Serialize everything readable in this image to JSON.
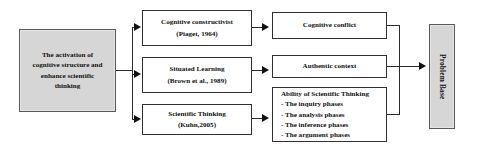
{
  "diagram": {
    "source": {
      "lines": [
        "The activation of",
        "cognitive structure and",
        "enhance scientific",
        "thinking"
      ]
    },
    "theories": [
      {
        "title": "Cognitive constructivist",
        "citation": "(Piaget, 1964)"
      },
      {
        "title": "Situated Learning",
        "citation": "(Brown et al., 1989)"
      },
      {
        "title": "Scientific Thinking",
        "citation": "(Kuhn,2005)"
      }
    ],
    "outcomes": [
      {
        "label": "Cognitive conflict"
      },
      {
        "label": "Authentic context"
      },
      {
        "heading": "Ability of Scientific Thinking",
        "phases": [
          "- The inquiry phases",
          "- The analysis phases",
          "- The inference phases",
          "- The argument phases"
        ]
      }
    ],
    "result": {
      "label": "Problem Base"
    },
    "colors": {
      "box_fill_white": "#ffffff",
      "box_fill_gray": "#d6d6d6",
      "border": "#2f2f2f",
      "connector": "#2b2b2b",
      "text": "#111111",
      "background": "#ffffff"
    }
  }
}
